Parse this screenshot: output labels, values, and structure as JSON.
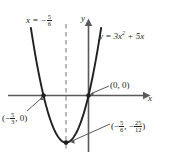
{
  "figure": {
    "width": 171,
    "height": 164,
    "background_color": "#ffffff",
    "ink_color": "#231f20",
    "curve_color": "#231f20",
    "axis_color": "#595959",
    "dashed_color": "#8c8c8c"
  },
  "labels": {
    "axis_of_symmetry": {
      "prefix": "x = −",
      "numerator": "5",
      "denominator": "6",
      "full_text": "x = −5/6"
    },
    "curve_equation": {
      "lhs": "y =",
      "term1_coeff": "3",
      "term1_var": "x",
      "term1_exponent": "2",
      "operator": "+",
      "term2": "5x",
      "full_text": "y = 3x² + 5x"
    },
    "y_axis": "y",
    "x_axis": "x",
    "origin_point": "(0, 0)",
    "root_point": {
      "open": "(−",
      "numerator": "5",
      "denominator": "3",
      "close": ", 0)",
      "full_text": "(−5/3, 0)"
    },
    "vertex_point": {
      "open": "(−",
      "x_numerator": "5",
      "x_denominator": "6",
      "middle": ", −",
      "y_numerator": "25",
      "y_denominator": "12",
      "close": ")",
      "full_text": "(−5/6, −25/12)"
    }
  },
  "chart_data": {
    "type": "line",
    "title": "",
    "subtitle": "",
    "xlabel": "x",
    "ylabel": "y",
    "function": "y = 3x^2 + 5x",
    "coefficients": {
      "a": 3,
      "b": 5,
      "c": 0
    },
    "axis_of_symmetry": -0.8333,
    "vertex": {
      "x": -0.8333,
      "y": -2.0833,
      "label": "(-5/6, -25/12)"
    },
    "x_intercepts": [
      {
        "x": -1.6667,
        "y": 0,
        "label": "(-5/3, 0)"
      },
      {
        "x": 0,
        "y": 0,
        "label": "(0, 0)"
      }
    ],
    "y_intercept": {
      "x": 0,
      "y": 0
    },
    "xlim": [
      -2.6,
      1.4
    ],
    "ylim": [
      -2.6,
      6.2
    ],
    "grid": false,
    "legend": false,
    "annotations": [
      {
        "text": "x = -5/6",
        "type": "dashed-vertical-line-label"
      },
      {
        "text": "y = 3x² + 5x",
        "type": "curve-label"
      },
      {
        "text": "(0, 0)",
        "type": "point-callout"
      },
      {
        "text": "(-5/3, 0)",
        "type": "point-callout"
      },
      {
        "text": "(-5/6, -25/12)",
        "type": "point-callout"
      }
    ],
    "x": [
      -2.2,
      -2.0,
      -1.8,
      -1.6667,
      -1.5,
      -1.25,
      -1.0,
      -0.8333,
      -0.6,
      -0.4,
      -0.2,
      0,
      0.2,
      0.4,
      0.55
    ],
    "values": [
      3.52,
      2.0,
      0.72,
      0.0,
      -0.75,
      -1.5625,
      -2.0,
      -2.0833,
      -1.92,
      -1.52,
      -0.88,
      0.0,
      1.12,
      2.48,
      3.66
    ]
  }
}
